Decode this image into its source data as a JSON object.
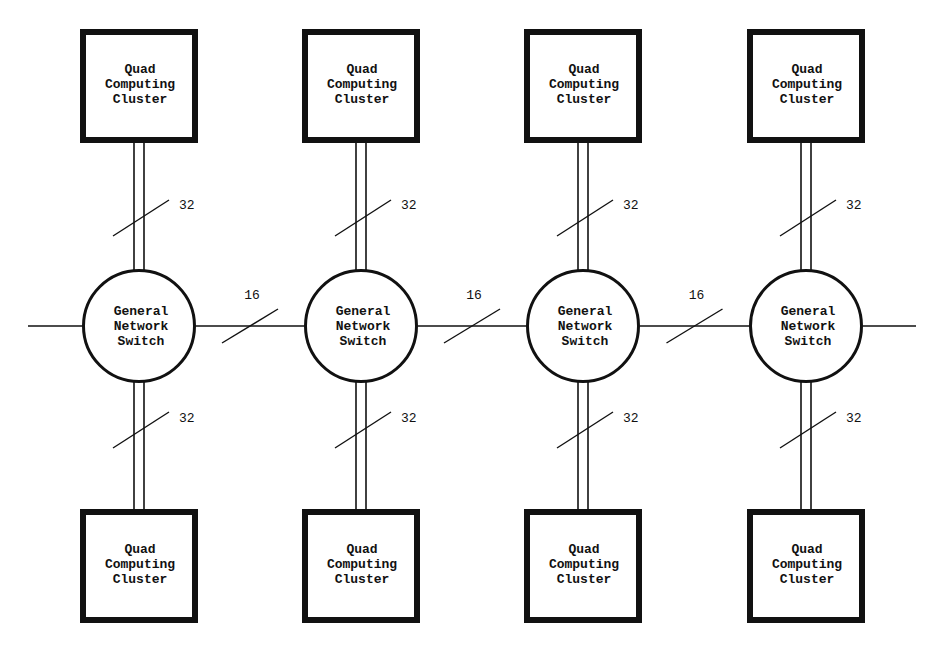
{
  "diagram": {
    "type": "network-topology",
    "columns": [
      {
        "x": 139,
        "top_cluster": {
          "lines": [
            "Quad",
            "Computing",
            "Cluster"
          ]
        },
        "switch": {
          "lines": [
            "General",
            "Network",
            "Switch"
          ]
        },
        "bottom_cluster": {
          "lines": [
            "Quad",
            "Computing",
            "Cluster"
          ]
        },
        "top_bus_width": "32",
        "bottom_bus_width": "32"
      },
      {
        "x": 361,
        "top_cluster": {
          "lines": [
            "Quad",
            "Computing",
            "Cluster"
          ]
        },
        "switch": {
          "lines": [
            "General",
            "Network",
            "Switch"
          ]
        },
        "bottom_cluster": {
          "lines": [
            "Quad",
            "Computing",
            "Cluster"
          ]
        },
        "top_bus_width": "32",
        "bottom_bus_width": "32"
      },
      {
        "x": 583,
        "top_cluster": {
          "lines": [
            "Quad",
            "Computing",
            "Cluster"
          ]
        },
        "switch": {
          "lines": [
            "General",
            "Network",
            "Switch"
          ]
        },
        "bottom_cluster": {
          "lines": [
            "Quad",
            "Computing",
            "Cluster"
          ]
        },
        "top_bus_width": "32",
        "bottom_bus_width": "32"
      },
      {
        "x": 806,
        "top_cluster": {
          "lines": [
            "Quad",
            "Computing",
            "Cluster"
          ]
        },
        "switch": {
          "lines": [
            "General",
            "Network",
            "Switch"
          ]
        },
        "bottom_cluster": {
          "lines": [
            "Quad",
            "Computing",
            "Cluster"
          ]
        },
        "top_bus_width": "32",
        "bottom_bus_width": "32"
      }
    ],
    "horizontal_links": [
      {
        "from": 0,
        "to": 1,
        "width": "16"
      },
      {
        "from": 1,
        "to": 2,
        "width": "16"
      },
      {
        "from": 2,
        "to": 3,
        "width": "16"
      }
    ],
    "colors": {
      "stroke": "#111111",
      "background": "#ffffff"
    }
  }
}
